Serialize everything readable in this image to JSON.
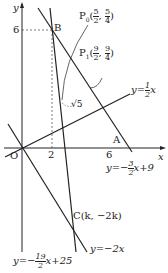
{
  "axes": {
    "x_label": "x",
    "y_label": "y",
    "origin_label": "O",
    "x_ticks": [
      "2",
      "6"
    ],
    "y_ticks": [
      "6"
    ]
  },
  "points": {
    "B": "B",
    "A": "A",
    "C": "C(k, −2k)",
    "P0": {
      "name": "P",
      "sub": "0",
      "x_num": "5",
      "x_den": "2",
      "y_num": "5",
      "y_den": "4"
    },
    "P1": {
      "name": "P",
      "sub": "1",
      "x_num": "9",
      "x_den": "2",
      "y_num": "9",
      "y_den": "4"
    }
  },
  "annotations": {
    "distance": "√5"
  },
  "lines": {
    "l1": {
      "prefix": "y=",
      "num": "1",
      "den": "2",
      "suffix": "x"
    },
    "l2": {
      "prefix": "y=−",
      "num": "3",
      "den": "2",
      "suffix": "x+9"
    },
    "l3": {
      "label": "y=−2x"
    },
    "l4": {
      "prefix": "y=−",
      "num": "19",
      "den": "2",
      "suffix": "x+25"
    }
  }
}
